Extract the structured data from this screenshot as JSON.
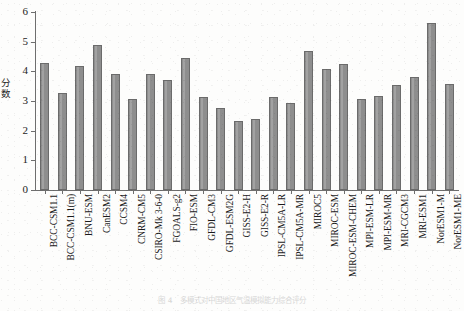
{
  "chart_data": {
    "type": "bar",
    "title": "",
    "xlabel": "",
    "ylabel": "分数",
    "ylim": [
      0,
      6
    ],
    "yticks": [
      0,
      1,
      2,
      3,
      4,
      5,
      6
    ],
    "grid": false,
    "legend": "none",
    "bar_color": "#8e8e8e",
    "bar_edge_color": "#6b6b6b",
    "categories": [
      "BCC-CSM1.1",
      "BCC-CSM1.1(m)",
      "BNU-ESM",
      "CanESM2",
      "CCSM4",
      "CNRM-CM5",
      "CSIRO-Mk 3-6-0",
      "FGOALS-g2",
      "FIO-ESM",
      "GFDL-CM3",
      "GFDL-ESM2G",
      "GISS-E2-H",
      "GISS-E2-R",
      "IPSL-CM5A-LR",
      "IPSL-CM5A-MR",
      "MIROC5",
      "MIROC-ESM",
      "MIROC-ESM-CHEM",
      "MPI-ESM-LR",
      "MPI-ESM-MR",
      "MRI-CGCM3",
      "MRI-ESM1",
      "NorESM1-M",
      "NorESM1-ME"
    ],
    "values": [
      4.28,
      3.27,
      4.17,
      4.9,
      3.92,
      3.07,
      3.92,
      3.72,
      4.44,
      3.15,
      2.75,
      2.33,
      2.38,
      3.15,
      2.93,
      4.68,
      4.07,
      4.25,
      3.07,
      3.17,
      3.53,
      3.8,
      5.63,
      3.58
    ]
  },
  "caption": {
    "text": "图 4   多模式对中国地区气温模拟能力综合评分"
  }
}
